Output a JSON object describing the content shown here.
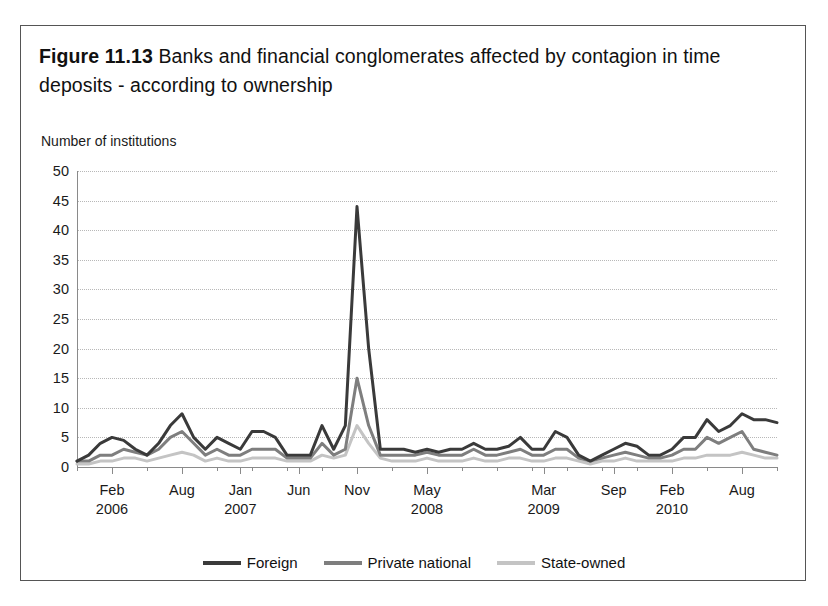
{
  "figure": {
    "number": "Figure 11.13",
    "caption": "Banks and financial conglomerates affected by contagion in time deposits - according to ownership"
  },
  "legend": {
    "position": "bottom-center",
    "items": [
      {
        "label": "Foreign",
        "color": "#3a3a3a"
      },
      {
        "label": "Private national",
        "color": "#7e7e7e"
      },
      {
        "label": "State-owned",
        "color": "#c4c4c4"
      }
    ]
  },
  "chart_data": {
    "type": "line",
    "title": "Banks and financial conglomerates affected by contagion in time deposits - according to ownership",
    "xlabel": "",
    "ylabel": "Number of institutions",
    "ylim": [
      0,
      50
    ],
    "yticks": [
      0,
      5,
      10,
      15,
      20,
      25,
      30,
      35,
      40,
      45,
      50
    ],
    "ytick_labels": [
      "0",
      "5",
      "10",
      "15",
      "20",
      "25",
      "30",
      "35",
      "40",
      "45",
      "50"
    ],
    "grid": "horizontal-dotted",
    "x_tick_labels": [
      {
        "month": "Feb",
        "year": "2006",
        "index": 3
      },
      {
        "month": "Aug",
        "year": "",
        "index": 9
      },
      {
        "month": "Jan",
        "year": "2007",
        "index": 14
      },
      {
        "month": "Jun",
        "year": "",
        "index": 19
      },
      {
        "month": "Nov",
        "year": "",
        "index": 24
      },
      {
        "month": "May",
        "year": "2008",
        "index": 30
      },
      {
        "month": "Mar",
        "year": "2009",
        "index": 40
      },
      {
        "month": "Sep",
        "year": "",
        "index": 46
      },
      {
        "month": "Feb",
        "year": "2010",
        "index": 51
      },
      {
        "month": "Aug",
        "year": "",
        "index": 57
      }
    ],
    "x": [
      0,
      1,
      2,
      3,
      4,
      5,
      6,
      7,
      8,
      9,
      10,
      11,
      12,
      13,
      14,
      15,
      16,
      17,
      18,
      19,
      20,
      21,
      22,
      23,
      24,
      25,
      26,
      27,
      28,
      29,
      30,
      31,
      32,
      33,
      34,
      35,
      36,
      37,
      38,
      39,
      40,
      41,
      42,
      43,
      44,
      45,
      46,
      47,
      48,
      49,
      50,
      51,
      52,
      53,
      54,
      55,
      56,
      57,
      58,
      59,
      60
    ],
    "series": [
      {
        "name": "Foreign",
        "color": "#3a3a3a",
        "values": [
          1,
          2,
          4,
          5,
          4.5,
          3,
          2,
          4,
          7,
          9,
          5,
          3,
          5,
          4,
          3,
          6,
          6,
          5,
          2,
          2,
          2,
          7,
          3,
          7,
          44,
          20,
          3,
          3,
          3,
          2.5,
          3,
          2.5,
          3,
          3,
          4,
          3,
          3,
          3.5,
          5,
          3,
          3,
          6,
          5,
          2,
          1,
          2,
          3,
          4,
          3.5,
          2,
          2,
          3,
          5,
          5,
          8,
          6,
          7,
          9,
          8,
          8,
          7.5
        ]
      },
      {
        "name": "Private national",
        "color": "#7e7e7e",
        "values": [
          1,
          1,
          2,
          2,
          3,
          2.5,
          2,
          3,
          5,
          6,
          4,
          2,
          3,
          2,
          2,
          3,
          3,
          3,
          1.5,
          1.5,
          1.5,
          4,
          2,
          3,
          15,
          7,
          2,
          2,
          2,
          2,
          2.5,
          2,
          2,
          2,
          3,
          2,
          2,
          2.5,
          3,
          2,
          2,
          3,
          3,
          1.5,
          1,
          1.5,
          2,
          2.5,
          2,
          1.5,
          1.5,
          2,
          3,
          3,
          5,
          4,
          5,
          6,
          3,
          2.5,
          2
        ]
      },
      {
        "name": "State-owned",
        "color": "#c4c4c4",
        "values": [
          0.5,
          0.5,
          1,
          1,
          1.5,
          1.5,
          1,
          1.5,
          2,
          2.5,
          2,
          1,
          1.5,
          1,
          1,
          1.5,
          1.5,
          1.5,
          1,
          1,
          1,
          2,
          1.5,
          2,
          7,
          4,
          1.5,
          1,
          1,
          1,
          1.5,
          1,
          1,
          1,
          1.5,
          1,
          1,
          1.5,
          1.5,
          1,
          1,
          1.5,
          1.5,
          1,
          0.5,
          1,
          1,
          1.5,
          1,
          1,
          1,
          1,
          1.5,
          1.5,
          2,
          2,
          2,
          2.5,
          2,
          1.5,
          1.5
        ]
      }
    ]
  }
}
